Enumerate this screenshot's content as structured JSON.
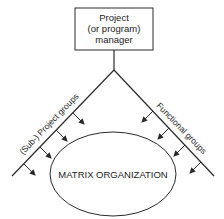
{
  "diagram": {
    "top_box": {
      "lines": [
        "Project",
        "(or program)",
        "manager"
      ]
    },
    "left_branch_label": "(Sub-) Project groups",
    "right_branch_label": "Functional groups",
    "center_label": "MATRIX ORGANIZATION",
    "colors": {
      "line": "#2a2a2a",
      "text": "#222222",
      "background": "#ffffff"
    }
  }
}
